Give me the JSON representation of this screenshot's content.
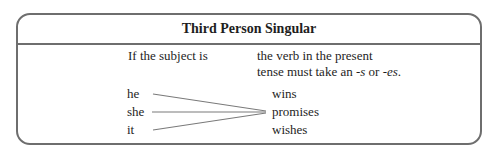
{
  "title": "Third Person Singular",
  "condition": {
    "left_label": "If the subject is",
    "right_line1": "the verb in the present",
    "right_line2_prefix": "tense must take an ",
    "suffix1": "-s",
    "right_line2_mid": " or ",
    "suffix2": "-es",
    "right_line2_end": "."
  },
  "subjects": [
    "he",
    "she",
    "it"
  ],
  "verbs": [
    "wins",
    "promises",
    "wishes"
  ],
  "colors": {
    "border": "#6e6e6e",
    "text": "#1e1e1e",
    "connector": "#7a7a7a"
  }
}
